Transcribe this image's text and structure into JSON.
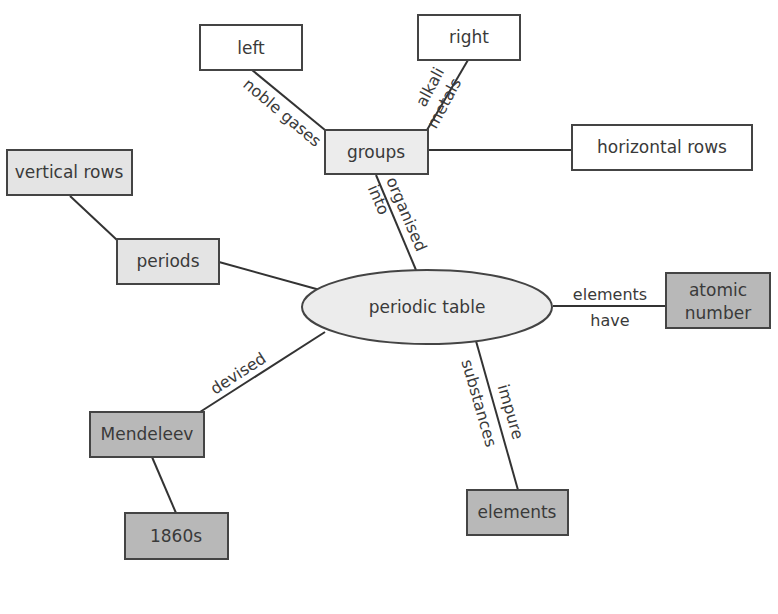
{
  "colors": {
    "white_fill": "#ffffff",
    "light_fill": "#e4e4e4",
    "dark_fill": "#b8b8b8",
    "stroke": "#444444"
  },
  "nodes": {
    "center": {
      "label": "periodic table"
    },
    "groups": {
      "label": "groups"
    },
    "left": {
      "label": "left"
    },
    "right": {
      "label": "right"
    },
    "horizontal_rows": {
      "label": "horizontal rows"
    },
    "vertical_rows": {
      "label": "vertical rows"
    },
    "periods": {
      "label": "periods"
    },
    "atomic_number": {
      "line1": "atomic",
      "line2": "number"
    },
    "mendeleev": {
      "label": "Mendeleev"
    },
    "year": {
      "label": "1860s"
    },
    "elements": {
      "label": "elements"
    }
  },
  "edges": {
    "noble_gases": {
      "label": "noble gases"
    },
    "alkali_metals": {
      "line1": "alkali",
      "line2": "metals"
    },
    "organised_into": {
      "line1": "organised",
      "line2": "into"
    },
    "elements_have": {
      "line1": "elements",
      "line2": "have"
    },
    "devised": {
      "label": "devised"
    },
    "impure_substances": {
      "line1": "impure",
      "line2": "substances"
    }
  }
}
